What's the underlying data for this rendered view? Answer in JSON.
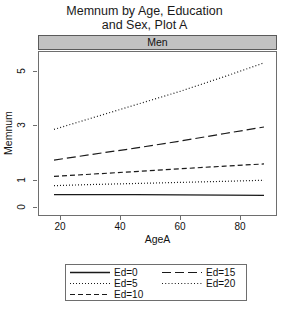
{
  "chart_data": {
    "type": "line",
    "title": "Memnum by Age, Education and Sex, Plot A",
    "title_line1": "Memnum by Age, Education",
    "title_line2": "and Sex, Plot A",
    "panel_label": "Men",
    "xlabel": "AgeA",
    "ylabel": "Memnum",
    "xlim": [
      13,
      92
    ],
    "ylim": [
      -0.3,
      5.7
    ],
    "xticks": [
      20,
      40,
      60,
      80
    ],
    "xtick_labels": [
      "20",
      "40",
      "60",
      "80"
    ],
    "yticks": [
      0,
      1,
      3,
      5
    ],
    "ytick_labels": [
      "0",
      "1",
      "3",
      "5"
    ],
    "grid": false,
    "legend_position": "bottom",
    "x": [
      18,
      30,
      45,
      60,
      75,
      88
    ],
    "series": [
      {
        "name": "Ed=0",
        "label": "Ed=0",
        "dash": "solid",
        "values": [
          0.45,
          0.45,
          0.45,
          0.44,
          0.43,
          0.42
        ]
      },
      {
        "name": "Ed=5",
        "label": "Ed=5",
        "dash": "dotted",
        "values": [
          0.78,
          0.82,
          0.86,
          0.9,
          0.94,
          0.98
        ]
      },
      {
        "name": "Ed=10",
        "label": "Ed=10",
        "dash": "dashed",
        "values": [
          1.12,
          1.2,
          1.3,
          1.4,
          1.5,
          1.58
        ]
      },
      {
        "name": "Ed=15",
        "label": "Ed=15",
        "dash": "longdash",
        "values": [
          1.72,
          1.92,
          2.16,
          2.42,
          2.7,
          2.94
        ]
      },
      {
        "name": "Ed=20",
        "label": "Ed=20",
        "dash": "dotdash",
        "values": [
          2.85,
          3.25,
          3.75,
          4.25,
          4.8,
          5.3
        ]
      }
    ],
    "legend_entries": [
      {
        "label": "Ed=0",
        "dash": "solid",
        "column": "left"
      },
      {
        "label": "Ed=5",
        "dash": "dotted",
        "column": "left"
      },
      {
        "label": "Ed=10",
        "dash": "dashed",
        "column": "left"
      },
      {
        "label": "Ed=15",
        "dash": "longdash",
        "column": "right"
      },
      {
        "label": "Ed=20",
        "dash": "dotdash",
        "column": "right"
      }
    ],
    "colors": {
      "line": "#1a1a1a",
      "frame": "#6e6e6e",
      "strip_fill": "#c2c2c2",
      "strip_border": "#5a5a5a",
      "background": "#ffffff",
      "text": "#111111"
    }
  }
}
